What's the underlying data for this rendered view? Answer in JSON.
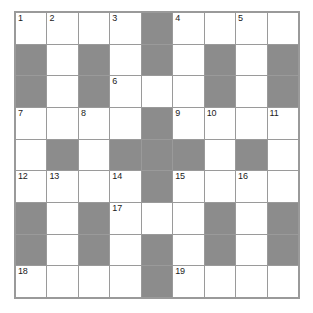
{
  "puzzle": {
    "title": "Crossword Grid",
    "rows": 9,
    "columns": 9,
    "colors": {
      "cell_background": "#ffffff",
      "block_background": "#8c8c8c",
      "grid_line": "#9a9a9a",
      "number_text": "#1b1b1b"
    },
    "grid": [
      [
        {
          "block": false,
          "number": "1"
        },
        {
          "block": false,
          "number": "2"
        },
        {
          "block": false,
          "number": ""
        },
        {
          "block": false,
          "number": "3"
        },
        {
          "block": true,
          "number": ""
        },
        {
          "block": false,
          "number": "4"
        },
        {
          "block": false,
          "number": ""
        },
        {
          "block": false,
          "number": "5"
        },
        {
          "block": false,
          "number": ""
        }
      ],
      [
        {
          "block": true,
          "number": ""
        },
        {
          "block": false,
          "number": ""
        },
        {
          "block": true,
          "number": ""
        },
        {
          "block": false,
          "number": ""
        },
        {
          "block": true,
          "number": ""
        },
        {
          "block": false,
          "number": ""
        },
        {
          "block": true,
          "number": ""
        },
        {
          "block": false,
          "number": ""
        },
        {
          "block": true,
          "number": ""
        }
      ],
      [
        {
          "block": true,
          "number": ""
        },
        {
          "block": false,
          "number": ""
        },
        {
          "block": true,
          "number": ""
        },
        {
          "block": false,
          "number": "6"
        },
        {
          "block": false,
          "number": ""
        },
        {
          "block": false,
          "number": ""
        },
        {
          "block": true,
          "number": ""
        },
        {
          "block": false,
          "number": ""
        },
        {
          "block": true,
          "number": ""
        }
      ],
      [
        {
          "block": false,
          "number": "7"
        },
        {
          "block": false,
          "number": ""
        },
        {
          "block": false,
          "number": "8"
        },
        {
          "block": false,
          "number": ""
        },
        {
          "block": true,
          "number": ""
        },
        {
          "block": false,
          "number": "9"
        },
        {
          "block": false,
          "number": "10"
        },
        {
          "block": false,
          "number": ""
        },
        {
          "block": false,
          "number": "11"
        }
      ],
      [
        {
          "block": false,
          "number": ""
        },
        {
          "block": true,
          "number": ""
        },
        {
          "block": false,
          "number": ""
        },
        {
          "block": true,
          "number": ""
        },
        {
          "block": true,
          "number": ""
        },
        {
          "block": true,
          "number": ""
        },
        {
          "block": false,
          "number": ""
        },
        {
          "block": true,
          "number": ""
        },
        {
          "block": false,
          "number": ""
        }
      ],
      [
        {
          "block": false,
          "number": "12"
        },
        {
          "block": false,
          "number": "13"
        },
        {
          "block": false,
          "number": ""
        },
        {
          "block": false,
          "number": "14"
        },
        {
          "block": true,
          "number": ""
        },
        {
          "block": false,
          "number": "15"
        },
        {
          "block": false,
          "number": ""
        },
        {
          "block": false,
          "number": "16"
        },
        {
          "block": false,
          "number": ""
        }
      ],
      [
        {
          "block": true,
          "number": ""
        },
        {
          "block": false,
          "number": ""
        },
        {
          "block": true,
          "number": ""
        },
        {
          "block": false,
          "number": "17"
        },
        {
          "block": false,
          "number": ""
        },
        {
          "block": false,
          "number": ""
        },
        {
          "block": true,
          "number": ""
        },
        {
          "block": false,
          "number": ""
        },
        {
          "block": true,
          "number": ""
        }
      ],
      [
        {
          "block": true,
          "number": ""
        },
        {
          "block": false,
          "number": ""
        },
        {
          "block": true,
          "number": ""
        },
        {
          "block": false,
          "number": ""
        },
        {
          "block": true,
          "number": ""
        },
        {
          "block": false,
          "number": ""
        },
        {
          "block": true,
          "number": ""
        },
        {
          "block": false,
          "number": ""
        },
        {
          "block": true,
          "number": ""
        }
      ],
      [
        {
          "block": false,
          "number": "18"
        },
        {
          "block": false,
          "number": ""
        },
        {
          "block": false,
          "number": ""
        },
        {
          "block": false,
          "number": ""
        },
        {
          "block": true,
          "number": ""
        },
        {
          "block": false,
          "number": "19"
        },
        {
          "block": false,
          "number": ""
        },
        {
          "block": false,
          "number": ""
        },
        {
          "block": false,
          "number": ""
        }
      ]
    ]
  }
}
